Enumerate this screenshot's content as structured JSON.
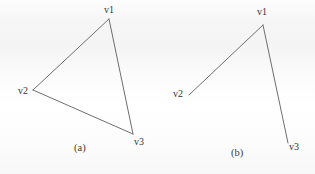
{
  "page": {
    "background_color": "#f8f8f8",
    "ink_color": "#6e6e6e",
    "text_color": "#343434",
    "width": 315,
    "height": 174
  },
  "figures": [
    {
      "id": "figure-a",
      "caption": "(a)",
      "caption_x": 74,
      "caption_y": 142,
      "closed": true,
      "description": "closed triangle on vertices v1, v2, v3",
      "vertices": [
        {
          "name": "v1",
          "x": 109,
          "y": 19,
          "label_x": 104,
          "label_y": 4
        },
        {
          "name": "v2",
          "x": 33,
          "y": 90,
          "label_x": 18,
          "label_y": 85
        },
        {
          "name": "v3",
          "x": 133,
          "y": 134,
          "label_x": 134,
          "label_y": 136
        }
      ],
      "edges": [
        {
          "from": "v1",
          "to": "v2"
        },
        {
          "from": "v2",
          "to": "v3"
        },
        {
          "from": "v3",
          "to": "v1"
        }
      ]
    },
    {
      "id": "figure-b",
      "caption": "(b)",
      "caption_x": 231,
      "caption_y": 147,
      "closed": false,
      "description": "open path v2 to v1 to v3; edge v2-v3 is absent",
      "vertices": [
        {
          "name": "v1",
          "x": 263,
          "y": 25,
          "label_x": 257,
          "label_y": 6
        },
        {
          "name": "v2",
          "x": 189,
          "y": 95,
          "label_x": 173,
          "label_y": 88
        },
        {
          "name": "v3",
          "x": 288,
          "y": 143,
          "label_x": 289,
          "label_y": 141
        }
      ],
      "edges": [
        {
          "from": "v2",
          "to": "v1"
        },
        {
          "from": "v1",
          "to": "v3"
        }
      ]
    }
  ]
}
